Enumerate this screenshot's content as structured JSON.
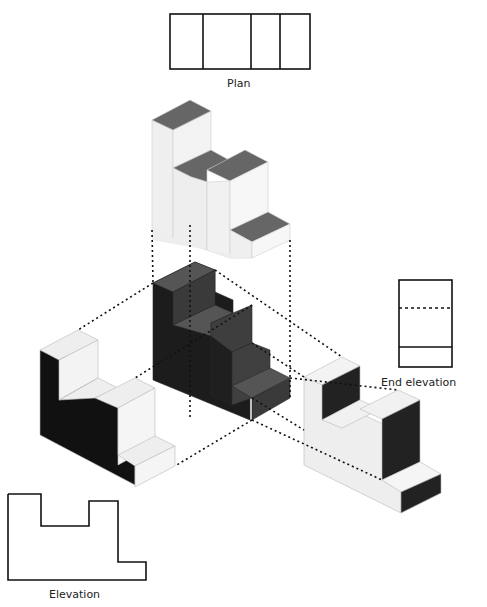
{
  "figure": {
    "type": "orthographic-projection"
  },
  "labels": {
    "plan": "Plan",
    "end_elevation": "End elevation",
    "elevation": "Elevation"
  },
  "colors": {
    "light_face": "#efefef",
    "mid_face": "#666666",
    "dark_face": "#1a1a1a",
    "darker_face": "#3a3a3a",
    "outline": "#111111"
  },
  "views": [
    {
      "name": "Plan",
      "shaded_faces": "top"
    },
    {
      "name": "Elevation",
      "shaded_faces": "front"
    },
    {
      "name": "End elevation",
      "shaded_faces": "side"
    }
  ]
}
